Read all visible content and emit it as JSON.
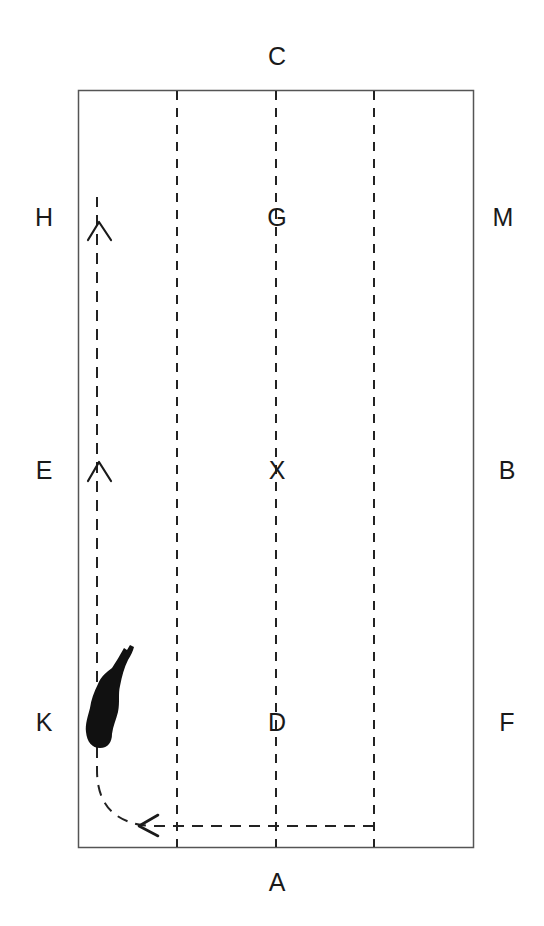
{
  "diagram": {
    "colors": {
      "background": "#ffffff",
      "arena_border": "#555555",
      "dashed_lines": "#222222",
      "path": "#222222",
      "horse": "#111111",
      "text": "#1a1a1a"
    },
    "arena": {
      "left": 78,
      "top": 90,
      "right": 473,
      "bottom": 847
    },
    "quarter_lines_x": [
      177,
      276,
      374
    ],
    "markers": [
      {
        "id": "C",
        "label": "C",
        "x": 277,
        "y": 56
      },
      {
        "id": "H",
        "label": "H",
        "x": 44,
        "y": 217
      },
      {
        "id": "G",
        "label": "G",
        "x": 277,
        "y": 217
      },
      {
        "id": "M",
        "label": "M",
        "x": 503,
        "y": 217
      },
      {
        "id": "E",
        "label": "E",
        "x": 44,
        "y": 470
      },
      {
        "id": "X",
        "label": "X",
        "x": 277,
        "y": 470
      },
      {
        "id": "B",
        "label": "B",
        "x": 507,
        "y": 470
      },
      {
        "id": "K",
        "label": "K",
        "x": 44,
        "y": 722
      },
      {
        "id": "D",
        "label": "D",
        "x": 277,
        "y": 722
      },
      {
        "id": "F",
        "label": "F",
        "x": 507,
        "y": 722
      },
      {
        "id": "A",
        "label": "A",
        "x": 277,
        "y": 882
      }
    ],
    "path": {
      "description": "Dashed track from right quarter line along A end, turning at corner near K, then up the left track past E to H",
      "start": [
        374,
        826
      ],
      "corner_turn": [
        97,
        770
      ],
      "end": [
        97,
        197
      ],
      "direction_arrows": [
        {
          "type": "up",
          "x": 99,
          "y": 228
        },
        {
          "type": "up",
          "x": 99,
          "y": 470
        },
        {
          "type": "left",
          "x": 150,
          "y": 826
        }
      ]
    },
    "horse": {
      "description": "Black top-down horse silhouette on left track between E and K, heading up",
      "x": 85,
      "y": 645
    }
  }
}
